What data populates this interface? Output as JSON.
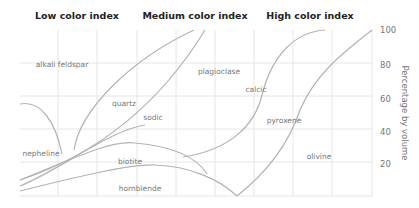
{
  "headers": {
    "low": "Low color index",
    "medium": "Medium color index",
    "high": "High color index"
  },
  "axis": {
    "ylabel": "Percentage by volume",
    "ticks": [
      "100",
      "80",
      "60",
      "40",
      "20"
    ]
  },
  "regions": {
    "alkali_feldspar": "alkali feldspar",
    "quartz": "quartz",
    "sodic": "sodic",
    "plagioclase": "plagioclase",
    "calcic": "calcic",
    "pyroxene": "pyroxene",
    "nepheline": "nepheline",
    "biotite": "biotite",
    "hornblende": "hornblende",
    "olivine": "olivine"
  },
  "colors": {
    "curve": "#b3b3b3",
    "grid": "#e6e6e6",
    "header_text": "#222222",
    "label_text": "#777777"
  }
}
